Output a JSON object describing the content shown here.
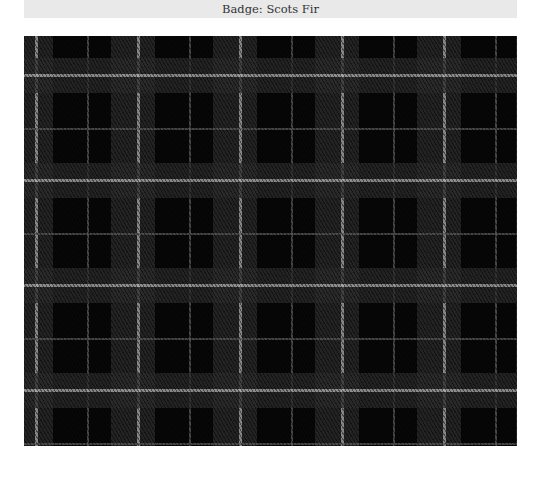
{
  "header": {
    "title": "Badge: Scots Fir"
  },
  "tartan": {
    "description": "Black and grey tartan with white overcheck",
    "colors": {
      "ground": "#070707",
      "band": "#2c2c2c",
      "overcheck": "#b0b0b0",
      "thin_line": "#5a5a5a"
    }
  }
}
